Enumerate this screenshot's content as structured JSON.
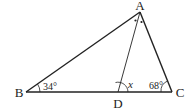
{
  "diagram": {
    "type": "triangle-geometry",
    "vertices": [
      {
        "name": "A",
        "label": "A",
        "x": 140,
        "y": 12,
        "label_x": 140,
        "label_y": 9
      },
      {
        "name": "B",
        "label": "B",
        "x": 26,
        "y": 92,
        "label_x": 19,
        "label_y": 97
      },
      {
        "name": "C",
        "label": "C",
        "x": 172,
        "y": 92,
        "label_x": 180,
        "label_y": 97
      },
      {
        "name": "D",
        "label": "D",
        "x": 118,
        "y": 92,
        "label_x": 118,
        "label_y": 108
      }
    ],
    "segments": [
      "AB",
      "AC",
      "BC",
      "AD"
    ],
    "angle_labels": {
      "B": "34°",
      "C": "68°",
      "ADC": "x"
    },
    "notes": {
      "angle_bisector": "Two dots at A mark angle BAD = angle DAC"
    },
    "colors": {
      "line": "#222222",
      "background": "#ffffff"
    }
  }
}
